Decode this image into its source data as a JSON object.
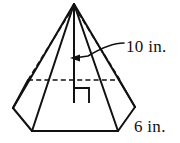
{
  "figure": {
    "kind": "hexagonal-pyramid",
    "background_color": "#ffffff",
    "line_color": "#111111",
    "labels": {
      "height": "10 in.",
      "base_edge": "6 in."
    },
    "annotations": {
      "right_angle_present": true,
      "height_leader_arrow": true
    },
    "geometry": {
      "apex": [
        74,
        4
      ],
      "base_center": [
        74,
        103
      ],
      "base_vertices_front": [
        [
          13,
          108
        ],
        [
          32,
          131
        ],
        [
          118,
          131
        ],
        [
          135,
          107
        ]
      ],
      "base_vertices_back": [
        [
          28,
          80
        ],
        [
          118,
          80
        ]
      ],
      "altitude_foot": [
        74,
        103
      ],
      "altitude_top": [
        74,
        6
      ],
      "arrow_tip": [
        70,
        58
      ],
      "leader_start": [
        124,
        43
      ],
      "label_height_pos": [
        126,
        52
      ],
      "label_base_pos": [
        134,
        132
      ]
    }
  }
}
